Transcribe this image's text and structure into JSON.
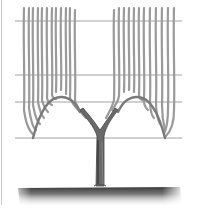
{
  "illustration": {
    "subject": "grapevine trained on trellis wires (double-arch cane system)",
    "wires": [
      21,
      75,
      103,
      138
    ],
    "wire_span": [
      15,
      182
    ],
    "colors": {
      "background": "#ffffff",
      "cane": "#9a9a9a",
      "cane_shade": "#6e6e6e",
      "wire": "#8a8a8a",
      "trunk": "#5a5a5a",
      "ground": "#3a3a3a"
    },
    "left_canes_x": [
      24,
      29,
      33,
      38,
      42,
      47,
      52,
      56,
      61,
      66,
      70
    ],
    "right_canes_x": [
      114,
      119,
      124,
      129,
      134,
      139,
      144,
      150,
      156,
      162,
      168,
      174
    ],
    "trunk": {
      "x": 100,
      "top": 140,
      "bottom": 188
    },
    "ground": {
      "top": 188,
      "left": 18,
      "right": 180
    }
  }
}
